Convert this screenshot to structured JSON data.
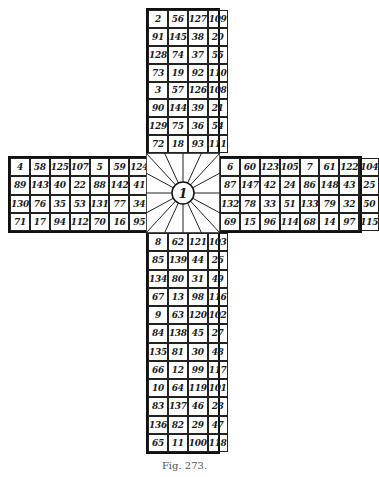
{
  "figure": {
    "caption": "Fig. 273.",
    "center_label": "1",
    "arms": {
      "top": {
        "rows": [
          [
            "2",
            "56",
            "127",
            "109"
          ],
          [
            "91",
            "145",
            "38",
            "20"
          ],
          [
            "128",
            "74",
            "37",
            "55"
          ],
          [
            "73",
            "19",
            "92",
            "110"
          ],
          [
            "3",
            "57",
            "126",
            "108"
          ],
          [
            "90",
            "144",
            "39",
            "21"
          ],
          [
            "129",
            "75",
            "36",
            "54"
          ],
          [
            "72",
            "18",
            "93",
            "111"
          ]
        ]
      },
      "left": {
        "rows": [
          [
            "4",
            "58",
            "125",
            "107",
            "5",
            "59",
            "124",
            "106"
          ],
          [
            "89",
            "143",
            "40",
            "22",
            "88",
            "142",
            "41",
            "23"
          ],
          [
            "130",
            "76",
            "35",
            "53",
            "131",
            "77",
            "34",
            "52"
          ],
          [
            "71",
            "17",
            "94",
            "112",
            "70",
            "16",
            "95",
            "113"
          ]
        ]
      },
      "right": {
        "rows": [
          [
            "6",
            "60",
            "123",
            "105",
            "7",
            "61",
            "122",
            "104"
          ],
          [
            "87",
            "147",
            "42",
            "24",
            "86",
            "148",
            "43",
            "25"
          ],
          [
            "132",
            "78",
            "33",
            "51",
            "133",
            "79",
            "32",
            "50"
          ],
          [
            "69",
            "15",
            "96",
            "114",
            "68",
            "14",
            "97",
            "115"
          ]
        ]
      },
      "bottom": {
        "rows": [
          [
            "8",
            "62",
            "121",
            "103"
          ],
          [
            "85",
            "139",
            "44",
            "26"
          ],
          [
            "134",
            "80",
            "31",
            "49"
          ],
          [
            "67",
            "13",
            "98",
            "116"
          ],
          [
            "9",
            "63",
            "120",
            "102"
          ],
          [
            "84",
            "138",
            "45",
            "27"
          ],
          [
            "135",
            "81",
            "30",
            "48"
          ],
          [
            "66",
            "12",
            "99",
            "117"
          ],
          [
            "10",
            "64",
            "119",
            "101"
          ],
          [
            "83",
            "137",
            "46",
            "28"
          ],
          [
            "136",
            "82",
            "29",
            "47"
          ],
          [
            "65",
            "11",
            "100",
            "118"
          ]
        ]
      }
    },
    "colors": {
      "ink": "#1a1a1a",
      "paper": "#ffffff",
      "caption": "#555555"
    }
  }
}
